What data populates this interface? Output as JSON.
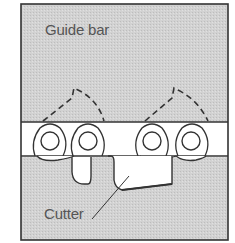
{
  "diagram": {
    "labels": {
      "guide_bar": "Guide bar",
      "cutter": "Cutter"
    },
    "colors": {
      "guide_bar_fill": "#cfcfcf",
      "chain_fill": "#ffffff",
      "line": "#333333"
    }
  }
}
